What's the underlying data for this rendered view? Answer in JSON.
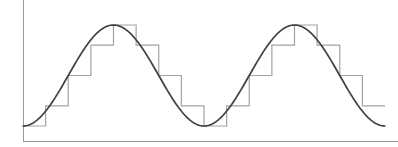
{
  "figure": {
    "background_color": "#ffffff",
    "width": 398,
    "height": 147
  },
  "colors": {
    "axis": "#9a9a9a",
    "signal": "#414141",
    "staircase": "#a3a3a3",
    "background": "#ffffff"
  },
  "axes": {
    "origin_x": 23,
    "origin_y": 141,
    "y_axis_top": 0,
    "x_axis_right": 398,
    "xlabel": "",
    "ylabel": "",
    "grid": false,
    "ticks": []
  },
  "chart_data": {
    "type": "line",
    "xlabel": "",
    "ylabel": "",
    "grid": false,
    "legend": [],
    "xlim": [
      0,
      2.0
    ],
    "ylim": [
      0,
      1
    ],
    "series": [
      {
        "name": "analog signal",
        "type": "line",
        "color": "#414141",
        "description": "continuous sinusoid, two full cycles starting at minimum",
        "waveform": "minus_cosine",
        "amplitude": 0.5,
        "offset": 0.5,
        "cycles": 2,
        "samples_per_cycle": 180,
        "x": [
          0,
          0.125,
          0.25,
          0.375,
          0.5,
          0.625,
          0.75,
          0.875,
          1.0,
          1.125,
          1.25,
          1.375,
          1.5,
          1.625,
          1.75,
          1.875,
          2.0
        ],
        "y": [
          0.0,
          0.146,
          0.5,
          0.854,
          1.0,
          0.854,
          0.5,
          0.146,
          0.0,
          0.146,
          0.5,
          0.854,
          1.0,
          0.854,
          0.5,
          0.146,
          0.0
        ]
      },
      {
        "name": "quantized staircase",
        "type": "step",
        "color": "#a3a3a3",
        "description": "sample-and-hold quantization of the sinusoid, 8 steps per cycle",
        "steps_per_cycle": 8,
        "quantization_levels": 6,
        "step_x_start": [
          0.0,
          0.125,
          0.25,
          0.375,
          0.5,
          0.625,
          0.75,
          0.875,
          1.0,
          1.125,
          1.25,
          1.375,
          1.5,
          1.625,
          1.75,
          1.875
        ],
        "step_values": [
          0.0,
          0.2,
          0.5,
          0.8,
          1.0,
          0.8,
          0.5,
          0.2,
          0.0,
          0.2,
          0.5,
          0.8,
          1.0,
          0.8,
          0.5,
          0.2
        ]
      }
    ]
  }
}
